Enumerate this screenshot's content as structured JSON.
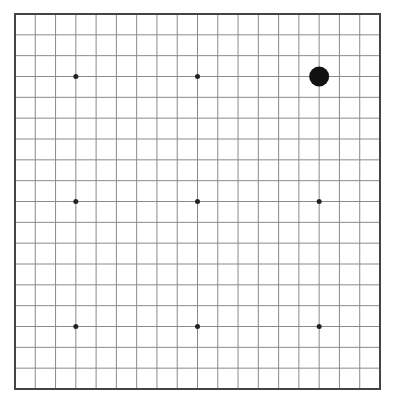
{
  "board": {
    "size": 19,
    "origin_x": 15,
    "origin_y": 14,
    "width": 365,
    "height": 375,
    "line_color": "#8a8a8a",
    "border_color": "#444444",
    "background": "#ffffff",
    "star_points": [
      [
        3,
        3
      ],
      [
        9,
        3
      ],
      [
        15,
        3
      ],
      [
        3,
        9
      ],
      [
        9,
        9
      ],
      [
        15,
        9
      ],
      [
        3,
        15
      ],
      [
        9,
        15
      ],
      [
        15,
        15
      ]
    ],
    "star_color": "#222222",
    "stones": [
      {
        "col": 15,
        "row": 3,
        "color": "black",
        "fill": "#111111"
      }
    ]
  }
}
